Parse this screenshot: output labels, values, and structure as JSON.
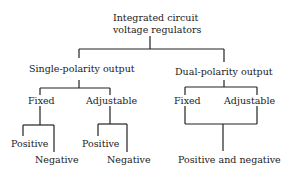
{
  "diagram": {
    "root": {
      "line1": "Integrated circuit",
      "line2": "voltage regulators"
    },
    "single": {
      "label": "Single-polarity output",
      "fixed": {
        "label": "Fixed",
        "pos": "Positive",
        "neg": "Negative"
      },
      "adjustable": {
        "label": "Adjustable",
        "pos": "Positive",
        "neg": "Negative"
      }
    },
    "dual": {
      "label": "Dual-polarity output",
      "fixed": "Fixed",
      "adjustable": "Adjustable",
      "output": "Positive and negative"
    },
    "colors": {
      "line": "#222222",
      "text": "#1a1a1a",
      "background": "#ffffff"
    }
  }
}
